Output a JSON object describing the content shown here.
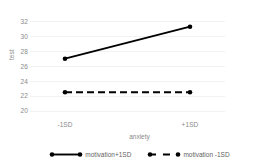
{
  "chart_data": {
    "type": "line",
    "title": "",
    "xlabel": "anxiety",
    "ylabel": "test",
    "categories": [
      "-1SD",
      "+1SD"
    ],
    "x": [
      0,
      1
    ],
    "xlim": [
      -0.28,
      1.28
    ],
    "ylim": [
      19.3,
      32.6
    ],
    "yticks": [
      20,
      22,
      24,
      26,
      28,
      30,
      32
    ],
    "ytick_labels": [
      "20",
      "22",
      "24",
      "26",
      "28",
      "30",
      "32"
    ],
    "xtick_labels": [
      "-1SD",
      "+1SD"
    ],
    "grid": "horizontal",
    "legend_position": "bottom",
    "series": [
      {
        "name": "motivation+1SD",
        "values": [
          27.0,
          31.3
        ],
        "style": "solid",
        "color": "#000000",
        "marker": "circle"
      },
      {
        "name": "motivation -1SD",
        "values": [
          22.5,
          22.5
        ],
        "style": "dashed",
        "color": "#000000",
        "marker": "circle"
      }
    ]
  },
  "legend": {
    "items": [
      {
        "label": "motivation+1SD",
        "style": "solid"
      },
      {
        "label": "motivation -1SD",
        "style": "dashed"
      }
    ]
  },
  "colors": {
    "background": "#ffffff",
    "gridline": "#f2f2f2",
    "axis": "#e3e3e3",
    "tick_text": "#8a8a8a",
    "legend_text": "#5f5f5f",
    "series": "#000000"
  }
}
